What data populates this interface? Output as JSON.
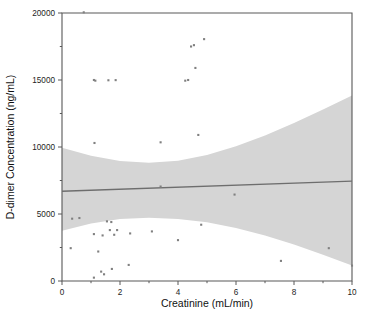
{
  "chart_data": {
    "type": "scatter",
    "title": "",
    "xlabel": "Creatinine (mL/min)",
    "ylabel": "D-dimer Concentration (ng/mL)",
    "xlim": [
      0,
      10
    ],
    "ylim": [
      0,
      20000
    ],
    "xticks": [
      0,
      2,
      4,
      6,
      8,
      10
    ],
    "xtick_labels": [
      "0",
      "2",
      "4",
      "6",
      "8",
      "10"
    ],
    "x_minor_ticks": [
      1,
      3,
      5,
      7,
      9
    ],
    "yticks": [
      0,
      5000,
      10000,
      15000,
      20000
    ],
    "ytick_labels": [
      "0",
      "5000",
      "10000",
      "15000",
      "20000"
    ],
    "y_minor_ticks": [
      2500,
      7500,
      12500,
      17500
    ],
    "grid": false,
    "legend": null,
    "series": [
      {
        "name": "Observations",
        "type": "scatter",
        "marker": "square",
        "color": "#808080",
        "points": [
          [
            0.75,
            20050
          ],
          [
            0.35,
            4650
          ],
          [
            0.3,
            2450
          ],
          [
            0.6,
            4700
          ],
          [
            1.1,
            15000
          ],
          [
            1.15,
            14950
          ],
          [
            1.12,
            10300
          ],
          [
            1.1,
            3500
          ],
          [
            1.1,
            250
          ],
          [
            1.25,
            2200
          ],
          [
            1.35,
            700
          ],
          [
            1.4,
            3400
          ],
          [
            1.45,
            500
          ],
          [
            1.55,
            4450
          ],
          [
            1.6,
            14980
          ],
          [
            1.65,
            3800
          ],
          [
            1.7,
            4400
          ],
          [
            1.72,
            900
          ],
          [
            1.8,
            3450
          ],
          [
            1.85,
            14990
          ],
          [
            1.9,
            3800
          ],
          [
            2.3,
            1200
          ],
          [
            2.35,
            3550
          ],
          [
            3.1,
            3700
          ],
          [
            3.4,
            10350
          ],
          [
            3.4,
            7050
          ],
          [
            4.0,
            3050
          ],
          [
            4.25,
            14950
          ],
          [
            4.35,
            15000
          ],
          [
            4.45,
            17500
          ],
          [
            4.55,
            17600
          ],
          [
            4.6,
            15900
          ],
          [
            4.7,
            10900
          ],
          [
            4.8,
            4200
          ],
          [
            4.9,
            18050
          ],
          [
            5.95,
            6450
          ],
          [
            7.55,
            1500
          ],
          [
            9.2,
            2450
          ],
          [
            10.0,
            1150
          ]
        ]
      },
      {
        "name": "Regression line",
        "type": "line",
        "color": "#6e6e6e",
        "x": [
          0,
          10
        ],
        "y": [
          6700,
          7450
        ]
      },
      {
        "name": "95% confidence band",
        "type": "band",
        "color": "#d5d5d5",
        "x": [
          0,
          1,
          2,
          3,
          4,
          5,
          6,
          7,
          8,
          9,
          10
        ],
        "upper": [
          9950,
          9350,
          8950,
          8830,
          8980,
          9400,
          10050,
          10850,
          11800,
          12800,
          13850
        ],
        "lower": [
          3750,
          4300,
          4620,
          4720,
          4620,
          4380,
          3950,
          3400,
          2720,
          1960,
          1150
        ]
      }
    ]
  },
  "colors": {
    "band": "#d5d5d5",
    "line": "#6e6e6e",
    "marker": "#808080",
    "axis": "#555555",
    "text": "#111111",
    "background": "#ffffff"
  }
}
